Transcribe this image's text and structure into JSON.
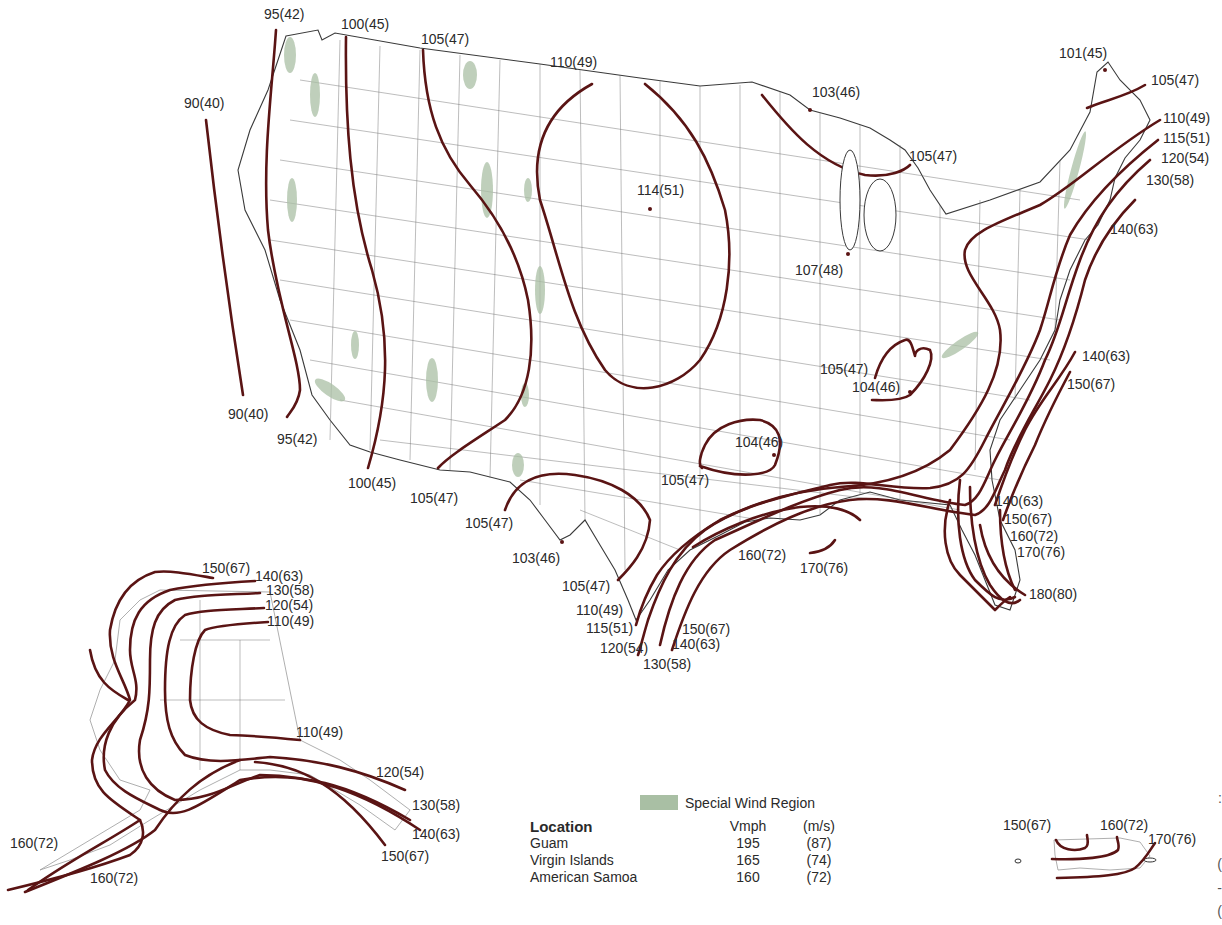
{
  "map": {
    "subject": "Basic wind speed contour map of the United States",
    "contour_color": "#5a1414",
    "special_region_color": "#a9bfa4",
    "contiguous_us_labels": [
      {
        "text": "95(42)",
        "x": 264,
        "y": 7
      },
      {
        "text": "100(45)",
        "x": 341,
        "y": 17
      },
      {
        "text": "105(47)",
        "x": 421,
        "y": 32
      },
      {
        "text": "110(49)",
        "x": 550,
        "y": 55
      },
      {
        "text": "90(40)",
        "x": 184,
        "y": 96
      },
      {
        "text": "103(46)",
        "x": 812,
        "y": 85
      },
      {
        "text": "101(45)",
        "x": 1059,
        "y": 46
      },
      {
        "text": "105(47)",
        "x": 1151,
        "y": 73
      },
      {
        "text": "110(49)",
        "x": 1163,
        "y": 111
      },
      {
        "text": "115(51)",
        "x": 1163,
        "y": 131
      },
      {
        "text": "120(54)",
        "x": 1161,
        "y": 151
      },
      {
        "text": "130(58)",
        "x": 1146,
        "y": 173
      },
      {
        "text": "105(47)",
        "x": 909,
        "y": 149
      },
      {
        "text": "114(51)",
        "x": 637,
        "y": 183
      },
      {
        "text": "140(63)",
        "x": 1110,
        "y": 222
      },
      {
        "text": "107(48)",
        "x": 795,
        "y": 263
      },
      {
        "text": "140(63)",
        "x": 1082,
        "y": 349
      },
      {
        "text": "105(47)",
        "x": 820,
        "y": 362
      },
      {
        "text": "104(46)",
        "x": 852,
        "y": 380
      },
      {
        "text": "150(67)",
        "x": 1067,
        "y": 377
      },
      {
        "text": "90(40)",
        "x": 228,
        "y": 407
      },
      {
        "text": "95(42)",
        "x": 277,
        "y": 432
      },
      {
        "text": "104(46)",
        "x": 735,
        "y": 435
      },
      {
        "text": "100(45)",
        "x": 348,
        "y": 476
      },
      {
        "text": "105(47)",
        "x": 661,
        "y": 473
      },
      {
        "text": "105(47)",
        "x": 410,
        "y": 491
      },
      {
        "text": "140(63)",
        "x": 995,
        "y": 494
      },
      {
        "text": "105(47)",
        "x": 465,
        "y": 516
      },
      {
        "text": "150(67)",
        "x": 1004,
        "y": 512
      },
      {
        "text": "160(72)",
        "x": 1010,
        "y": 529
      },
      {
        "text": "170(76)",
        "x": 1017,
        "y": 545
      },
      {
        "text": "103(46)",
        "x": 512,
        "y": 551
      },
      {
        "text": "160(72)",
        "x": 738,
        "y": 548
      },
      {
        "text": "170(76)",
        "x": 800,
        "y": 561
      },
      {
        "text": "105(47)",
        "x": 562,
        "y": 579
      },
      {
        "text": "180(80)",
        "x": 1029,
        "y": 587
      },
      {
        "text": "110(49)",
        "x": 576,
        "y": 603
      },
      {
        "text": "115(51)",
        "x": 586,
        "y": 621
      },
      {
        "text": "150(67)",
        "x": 682,
        "y": 622
      },
      {
        "text": "140(63)",
        "x": 672,
        "y": 637
      },
      {
        "text": "120(54)",
        "x": 600,
        "y": 641
      },
      {
        "text": "130(58)",
        "x": 643,
        "y": 657
      }
    ],
    "alaska_labels": [
      {
        "text": "150(67)",
        "x": 202,
        "y": 561
      },
      {
        "text": "140(63)",
        "x": 255,
        "y": 569
      },
      {
        "text": "130(58)",
        "x": 266,
        "y": 583
      },
      {
        "text": "120(54)",
        "x": 265,
        "y": 598
      },
      {
        "text": "110(49)",
        "x": 267,
        "y": 614
      },
      {
        "text": "110(49)",
        "x": 296,
        "y": 725
      },
      {
        "text": "120(54)",
        "x": 376,
        "y": 765
      },
      {
        "text": "130(58)",
        "x": 412,
        "y": 798
      },
      {
        "text": "140(63)",
        "x": 412,
        "y": 827
      },
      {
        "text": "160(72)",
        "x": 10,
        "y": 836
      },
      {
        "text": "150(67)",
        "x": 381,
        "y": 849
      },
      {
        "text": "160(72)",
        "x": 90,
        "y": 871
      }
    ],
    "puerto_rico_labels": [
      {
        "text": "150(67)",
        "x": 1003,
        "y": 818
      },
      {
        "text": "160(72)",
        "x": 1100,
        "y": 818
      },
      {
        "text": "170(76)",
        "x": 1148,
        "y": 832
      }
    ]
  },
  "legend": {
    "special_wind_region_label": "Special Wind Region",
    "table": {
      "headers": [
        "Location",
        "Vmph",
        "(m/s)"
      ],
      "rows": [
        [
          "Guam",
          "195",
          "(87)"
        ],
        [
          "Virgin Islands",
          "165",
          "(74)"
        ],
        [
          "American Samoa",
          "160",
          "(72)"
        ]
      ]
    }
  },
  "edge_fragments": [
    ":",
    "(",
    "-",
    "("
  ]
}
